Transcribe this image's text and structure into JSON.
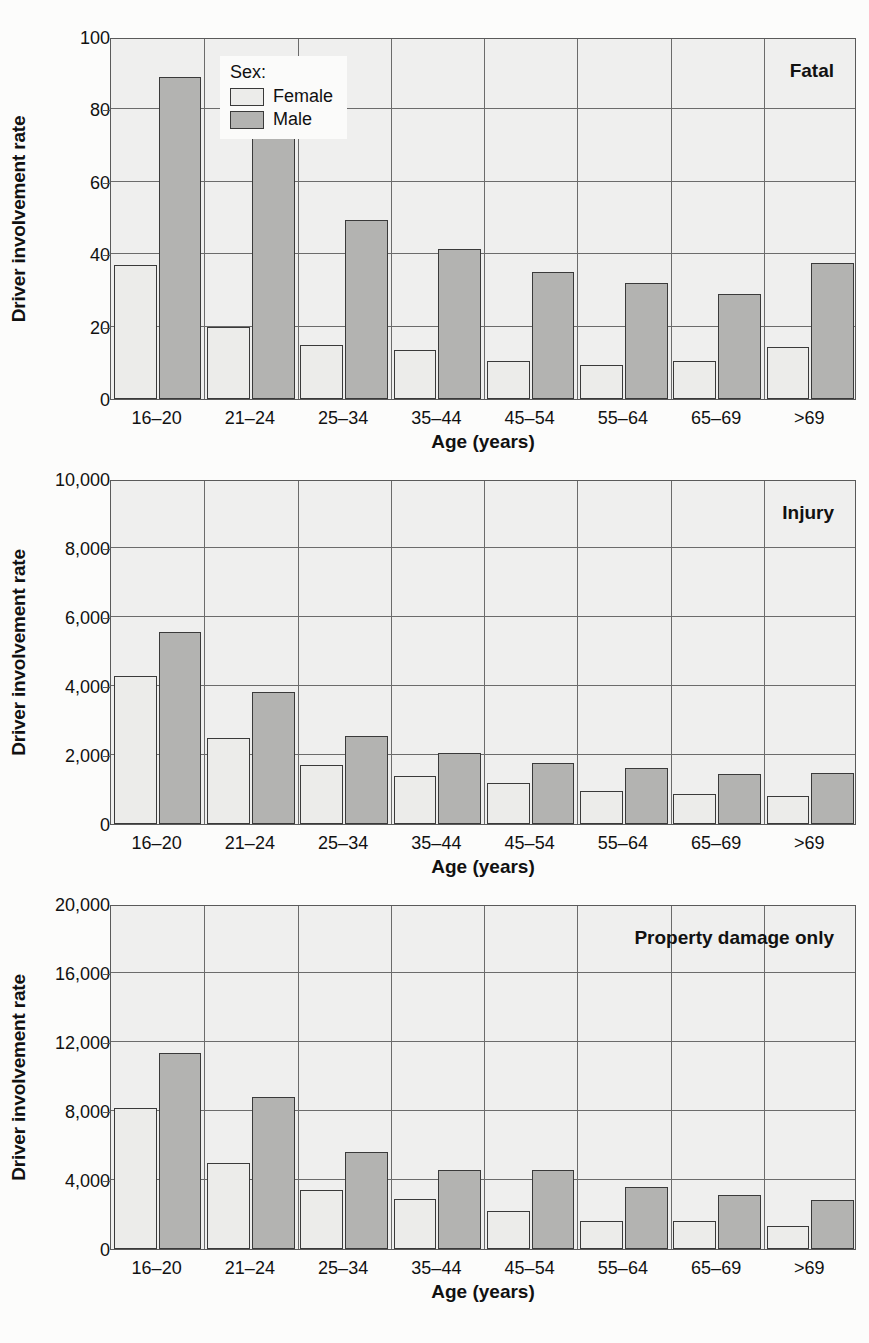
{
  "figure": {
    "background_color": "#fcfcfb",
    "female_color": "#ececea",
    "male_color": "#b3b3b1",
    "axis_color": "#5a5a5a"
  },
  "legend": {
    "title": "Sex:",
    "entries": [
      {
        "label": "Female",
        "color": "#ececea"
      },
      {
        "label": "Male",
        "color": "#b3b3b1"
      }
    ]
  },
  "axis_titles": {
    "y": "Driver involvement rate",
    "x": "Age (years)"
  },
  "chart_data": [
    {
      "type": "bar",
      "title": "Fatal",
      "xlabel": "Age (years)",
      "ylabel": "Driver involvement rate",
      "ylim": [
        0,
        100
      ],
      "yticks": [
        0,
        20,
        40,
        60,
        80,
        100
      ],
      "ytick_labels": [
        "0",
        "20",
        "40",
        "60",
        "80",
        "100"
      ],
      "grid": true,
      "legend_position": "top-left-inside",
      "categories": [
        "16–20",
        "21–24",
        "25–34",
        "35–44",
        "45–54",
        "55–64",
        "65–69",
        ">69"
      ],
      "series": [
        {
          "name": "Female",
          "values": [
            37,
            20,
            15,
            13.5,
            10.5,
            9.5,
            10.5,
            14.5
          ]
        },
        {
          "name": "Male",
          "values": [
            89,
            73,
            49.5,
            41.5,
            35,
            32,
            29,
            37.5
          ]
        }
      ]
    },
    {
      "type": "bar",
      "title": "Injury",
      "xlabel": "Age (years)",
      "ylabel": "Driver involvement rate",
      "ylim": [
        0,
        10000
      ],
      "yticks": [
        0,
        2000,
        4000,
        6000,
        8000,
        10000
      ],
      "ytick_labels": [
        "0",
        "2,000",
        "4,000",
        "6,000",
        "8,000",
        "10,000"
      ],
      "grid": true,
      "legend_position": "none",
      "categories": [
        "16–20",
        "21–24",
        "25–34",
        "35–44",
        "45–54",
        "55–64",
        "65–69",
        ">69"
      ],
      "series": [
        {
          "name": "Female",
          "values": [
            4300,
            2500,
            1700,
            1400,
            1200,
            950,
            880,
            800
          ]
        },
        {
          "name": "Male",
          "values": [
            5570,
            3830,
            2560,
            2060,
            1760,
            1620,
            1450,
            1470
          ]
        }
      ]
    },
    {
      "type": "bar",
      "title": "Property damage only",
      "xlabel": "Age (years)",
      "ylabel": "Driver involvement rate",
      "ylim": [
        0,
        20000
      ],
      "yticks": [
        0,
        4000,
        8000,
        12000,
        16000,
        20000
      ],
      "ytick_labels": [
        "0",
        "4,000",
        "8,000",
        "12,000",
        "16,000",
        "20,000"
      ],
      "grid": true,
      "legend_position": "none",
      "categories": [
        "16–20",
        "21–24",
        "25–34",
        "35–44",
        "45–54",
        "55–64",
        "65–69",
        ">69"
      ],
      "series": [
        {
          "name": "Female",
          "values": [
            8200,
            5000,
            3400,
            2900,
            2200,
            1650,
            1650,
            1350
          ]
        },
        {
          "name": "Male",
          "values": [
            11350,
            8800,
            5600,
            4600,
            4600,
            3600,
            3150,
            2850
          ]
        }
      ]
    }
  ]
}
